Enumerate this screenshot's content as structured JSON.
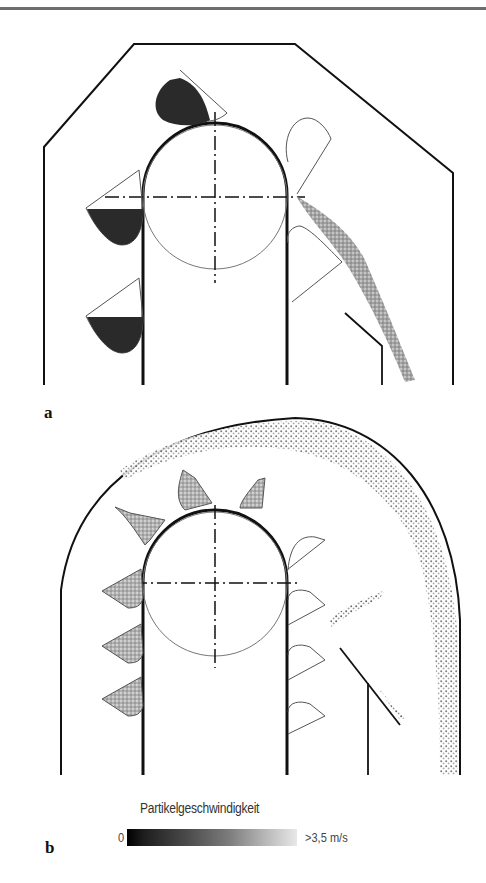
{
  "figure": {
    "panels": [
      {
        "label": "a",
        "description": "Bucket elevator head – slow discharge (gravity), particles dark/low speed"
      },
      {
        "label": "b",
        "description": "Bucket elevator head – fast discharge (centrifugal), particles spread along housing"
      }
    ]
  },
  "legend": {
    "title": "Partikelgeschwindigkeit",
    "min_label": "0",
    "max_label": ">3,5 m/s",
    "gradient_start": "#000000",
    "gradient_end": "#e8e8e8"
  },
  "colors": {
    "outline": "#111111",
    "thin_line": "#555555",
    "slow_particles": "#2a2a2a",
    "fast_particles": "#9a9a9a"
  }
}
